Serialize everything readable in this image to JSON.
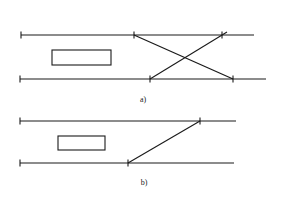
{
  "diagram": {
    "panels": [
      {
        "label": "a)",
        "type": "scissors-crossover",
        "tracks": [
          {
            "y": 35,
            "x1": 21,
            "x2": 254,
            "ticks": [
              21,
              134,
              222
            ]
          },
          {
            "y": 79,
            "x1": 20,
            "x2": 266,
            "ticks": [
              20,
              150,
              233
            ]
          }
        ],
        "connections": [
          {
            "x1": 134,
            "y1": 35,
            "x2": 233,
            "y2": 79
          },
          {
            "x1": 150,
            "y1": 79,
            "x2": 227,
            "y2": 32
          }
        ],
        "building": {
          "x": 52,
          "y": 50,
          "w": 59,
          "h": 15
        },
        "label_pos": {
          "x": 143,
          "y": 102
        }
      },
      {
        "label": "b)",
        "type": "single-crossover",
        "tracks": [
          {
            "y": 121,
            "x1": 20,
            "x2": 236,
            "ticks": [
              20,
              200
            ]
          },
          {
            "y": 163,
            "x1": 20,
            "x2": 234,
            "ticks": [
              20,
              128
            ]
          }
        ],
        "connections": [
          {
            "x1": 128,
            "y1": 163,
            "x2": 200,
            "y2": 121
          }
        ],
        "building": {
          "x": 58,
          "y": 136,
          "w": 47,
          "h": 14
        },
        "label_pos": {
          "x": 144,
          "y": 185
        }
      }
    ]
  }
}
